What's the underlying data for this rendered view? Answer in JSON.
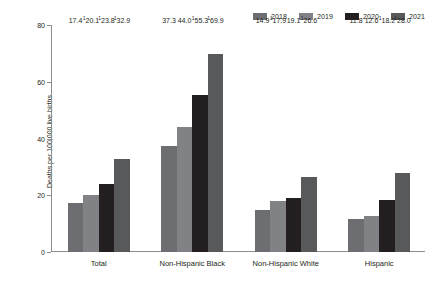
{
  "chart_data": {
    "type": "bar",
    "title": "",
    "subtitle": "",
    "xlabel": "",
    "ylabel": "Deaths per 100,000 live births",
    "ylim": [
      0,
      80
    ],
    "yticks": [
      "0",
      "20",
      "40",
      "60",
      "80"
    ],
    "grid": false,
    "legend_position": "top-right",
    "categories": [
      "Total",
      "Non-Hispanic Black",
      "Non-Hispanic White",
      "Hispanic"
    ],
    "series": [
      {
        "name": "2018",
        "color": "#6d6e71",
        "values": [
          17.4,
          37.3,
          14.9,
          11.8
        ],
        "labels": [
          "17.4",
          "37.3",
          "14.9",
          "11.8"
        ],
        "footnotes": [
          "",
          "",
          "",
          ""
        ]
      },
      {
        "name": "2019",
        "color": "#808285",
        "values": [
          20.1,
          44.0,
          17.9,
          12.6
        ],
        "labels": [
          "20.1",
          "44.0",
          "17.9",
          "12.6"
        ],
        "footnotes": [
          "1",
          "",
          "1",
          ""
        ]
      },
      {
        "name": "2020",
        "color": "#231f20",
        "values": [
          23.8,
          55.3,
          19.1,
          18.2
        ],
        "labels": [
          "23.8",
          "55.3",
          "19.1",
          "18.2"
        ],
        "footnotes": [
          "1",
          "1",
          "",
          "1"
        ]
      },
      {
        "name": "2021",
        "color": "#58595b",
        "values": [
          32.9,
          69.9,
          26.6,
          28.0
        ],
        "labels": [
          "32.9",
          "69.9",
          "26.6",
          "28.0"
        ],
        "footnotes": [
          "1",
          "1",
          "1",
          "1"
        ]
      }
    ]
  },
  "legend": {
    "items": [
      {
        "label": "2018",
        "color": "#6d6e71"
      },
      {
        "label": "2019",
        "color": "#808285"
      },
      {
        "label": "2020",
        "color": "#231f20"
      },
      {
        "label": "2021",
        "color": "#58595b"
      }
    ]
  },
  "axis": {
    "y_title": "Deaths per 100,000 live births",
    "y_ticks": [
      "80",
      "60",
      "40",
      "20",
      "0"
    ]
  },
  "categories": [
    "Total",
    "Non-Hispanic Black",
    "Non-Hispanic White",
    "Hispanic"
  ]
}
